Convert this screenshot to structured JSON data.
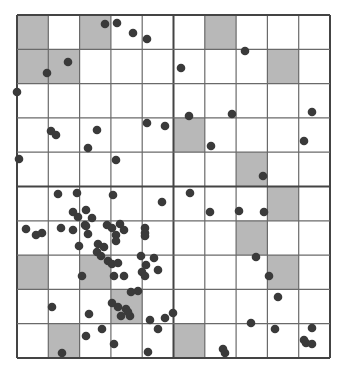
{
  "figure": {
    "grid": {
      "left": 17,
      "top": 15,
      "cols": 10,
      "rows": 10,
      "cell_w": 31.3,
      "cell_h": 34.3,
      "line_color": "#6a6a6a",
      "major_line_color": "#444444"
    },
    "colors": {
      "shade": "#b8b8b8",
      "point": "#3a3a3a",
      "background": "#ffffff"
    },
    "shaded_cells": [
      [
        0,
        0
      ],
      [
        2,
        0
      ],
      [
        6,
        0
      ],
      [
        0,
        1
      ],
      [
        1,
        1
      ],
      [
        8,
        1
      ],
      [
        5,
        3
      ],
      [
        7,
        4
      ],
      [
        8,
        5
      ],
      [
        7,
        6
      ],
      [
        0,
        7
      ],
      [
        2,
        7
      ],
      [
        8,
        7
      ],
      [
        3,
        8
      ],
      [
        1,
        9
      ],
      [
        5,
        9
      ]
    ],
    "points": [
      [
        105,
        24
      ],
      [
        117,
        23
      ],
      [
        133,
        33
      ],
      [
        147,
        39
      ],
      [
        68,
        62
      ],
      [
        47,
        73
      ],
      [
        17,
        92
      ],
      [
        51,
        131
      ],
      [
        56,
        135
      ],
      [
        97,
        130
      ],
      [
        88,
        148
      ],
      [
        19,
        159
      ],
      [
        116,
        160
      ],
      [
        147,
        123
      ],
      [
        165,
        126
      ],
      [
        181,
        68
      ],
      [
        245,
        51
      ],
      [
        189,
        116
      ],
      [
        232,
        114
      ],
      [
        312,
        112
      ],
      [
        304,
        141
      ],
      [
        211,
        146
      ],
      [
        263,
        176
      ],
      [
        58,
        194
      ],
      [
        77,
        193
      ],
      [
        113,
        195
      ],
      [
        162,
        202
      ],
      [
        190,
        193
      ],
      [
        210,
        212
      ],
      [
        239,
        211
      ],
      [
        264,
        212
      ],
      [
        26,
        229
      ],
      [
        36,
        235
      ],
      [
        42,
        233
      ],
      [
        61,
        228
      ],
      [
        73,
        212
      ],
      [
        86,
        210
      ],
      [
        92,
        218
      ],
      [
        78,
        217
      ],
      [
        85,
        225
      ],
      [
        73,
        230
      ],
      [
        86,
        226
      ],
      [
        88,
        234
      ],
      [
        107,
        225
      ],
      [
        112,
        228
      ],
      [
        120,
        224
      ],
      [
        116,
        235
      ],
      [
        124,
        230
      ],
      [
        145,
        228
      ],
      [
        145,
        233
      ],
      [
        145,
        236
      ],
      [
        98,
        244
      ],
      [
        104,
        247
      ],
      [
        116,
        241
      ],
      [
        79,
        246
      ],
      [
        97,
        252
      ],
      [
        101,
        256
      ],
      [
        108,
        261
      ],
      [
        82,
        276
      ],
      [
        112,
        264
      ],
      [
        118,
        263
      ],
      [
        141,
        256
      ],
      [
        146,
        265
      ],
      [
        154,
        258
      ],
      [
        158,
        270
      ],
      [
        114,
        276
      ],
      [
        124,
        276
      ],
      [
        142,
        272
      ],
      [
        145,
        276
      ],
      [
        138,
        291
      ],
      [
        256,
        257
      ],
      [
        269,
        276
      ],
      [
        278,
        297
      ],
      [
        52,
        307
      ],
      [
        89,
        314
      ],
      [
        112,
        303
      ],
      [
        118,
        307
      ],
      [
        126,
        309
      ],
      [
        121,
        316
      ],
      [
        130,
        316
      ],
      [
        128,
        312
      ],
      [
        150,
        320
      ],
      [
        173,
        313
      ],
      [
        102,
        329
      ],
      [
        158,
        329
      ],
      [
        251,
        323
      ],
      [
        275,
        329
      ],
      [
        312,
        328
      ],
      [
        304,
        340
      ],
      [
        86,
        336
      ],
      [
        62,
        353
      ],
      [
        114,
        344
      ],
      [
        148,
        352
      ],
      [
        223,
        349
      ],
      [
        225,
        353
      ],
      [
        306,
        343
      ],
      [
        312,
        344
      ],
      [
        165,
        318
      ],
      [
        131,
        292
      ]
    ]
  }
}
